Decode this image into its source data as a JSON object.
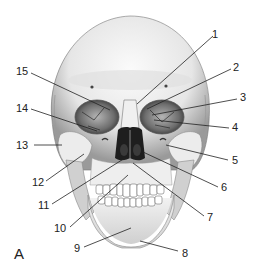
{
  "figure": {
    "panel_label": "A",
    "colors": {
      "bone_light": "#f4f4f4",
      "bone_mid": "#cfcfcf",
      "bone_shadow": "#8a8a8a",
      "cavity": "#1e1e1e",
      "line": "#222222"
    }
  },
  "labels": [
    {
      "id": "1",
      "text": "1",
      "x": 212,
      "y": 29,
      "tx": 137,
      "ty": 104,
      "lx": 213,
      "ly": 36
    },
    {
      "id": "2",
      "text": "2",
      "x": 233,
      "y": 62,
      "tx": 147,
      "ty": 109,
      "lx": 231,
      "ly": 69
    },
    {
      "id": "3",
      "text": "3",
      "x": 240,
      "y": 92,
      "tx": 152,
      "ty": 115,
      "lx": 237,
      "ly": 99
    },
    {
      "id": "4",
      "text": "4",
      "x": 232,
      "y": 122,
      "tx": 154,
      "ty": 120,
      "lx": 229,
      "ly": 128
    },
    {
      "id": "5",
      "text": "5",
      "x": 232,
      "y": 155,
      "tx": 166,
      "ty": 145,
      "lx": 228,
      "ly": 160
    },
    {
      "id": "6",
      "text": "6",
      "x": 221,
      "y": 182,
      "tx": 143,
      "ty": 152,
      "lx": 218,
      "ly": 187
    },
    {
      "id": "7",
      "text": "7",
      "x": 207,
      "y": 216,
      "tx": 133,
      "ty": 163,
      "lx": 204,
      "ly": 216
    },
    {
      "id": "8",
      "text": "8",
      "x": 182,
      "y": 248,
      "tx": 140,
      "ty": 241,
      "lx": 178,
      "ly": 251
    },
    {
      "id": "9",
      "text": "9",
      "x": 74,
      "y": 244,
      "tx": 131,
      "ty": 228,
      "lx": 84,
      "ly": 247
    },
    {
      "id": "10",
      "text": "10",
      "x": 54,
      "y": 225,
      "tx": 128,
      "ty": 175,
      "lx": 70,
      "ly": 227
    },
    {
      "id": "11",
      "text": "11",
      "x": 38,
      "y": 201,
      "tx": 125,
      "ty": 158,
      "lx": 52,
      "ly": 204
    },
    {
      "id": "12",
      "text": "12",
      "x": 32,
      "y": 178,
      "tx": 84,
      "ty": 154,
      "lx": 46,
      "ly": 181
    },
    {
      "id": "13",
      "text": "13",
      "x": 16,
      "y": 140,
      "tx": 62,
      "ty": 145,
      "lx": 34,
      "ly": 145
    },
    {
      "id": "14",
      "text": "14",
      "x": 16,
      "y": 103,
      "tx": 97,
      "ty": 131,
      "lx": 31,
      "ly": 109
    },
    {
      "id": "15",
      "text": "15",
      "x": 16,
      "y": 66,
      "tx": 110,
      "ty": 110,
      "lx": 31,
      "ly": 73
    }
  ]
}
